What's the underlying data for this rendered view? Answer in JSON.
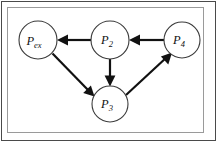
{
  "figure": {
    "type": "directed-graph-diagram",
    "background_color": "#ffffff",
    "outer_border_color": "#4a4a4a",
    "inner_frame_color": "#9a9a9a",
    "node_stroke_color": "#3b3b3b",
    "edge_color": "#111111",
    "caption_fragment": ""
  },
  "nodes": [
    {
      "id": "p_ex",
      "base": "P",
      "subscript": "ex",
      "cx": 38,
      "cy": 40,
      "r": 19
    },
    {
      "id": "p2",
      "base": "P",
      "subscript": "2",
      "cx": 110,
      "cy": 40,
      "r": 19
    },
    {
      "id": "p4",
      "base": "P",
      "subscript": "4",
      "cx": 182,
      "cy": 40,
      "r": 18
    },
    {
      "id": "p3",
      "base": "P",
      "subscript": "3",
      "cx": 110,
      "cy": 104,
      "r": 18
    }
  ],
  "edges": [
    {
      "id": "e-p2-pex",
      "from": "p2",
      "to": "p_ex",
      "direction": "left"
    },
    {
      "id": "e-p4-p2",
      "from": "p4",
      "to": "p2",
      "direction": "left"
    },
    {
      "id": "e-pex-p3",
      "from": "p_ex",
      "to": "p3",
      "direction": "down-right"
    },
    {
      "id": "e-p2-p3",
      "from": "p2",
      "to": "p3",
      "direction": "down"
    },
    {
      "id": "e-p3-p4",
      "from": "p3",
      "to": "p4",
      "direction": "up-right"
    }
  ]
}
